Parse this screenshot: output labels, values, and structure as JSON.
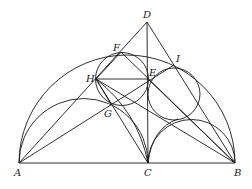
{
  "figure": {
    "type": "geometry-diagram",
    "points": {
      "A": {
        "label": "A",
        "x": 19,
        "y": 163
      },
      "B": {
        "label": "B",
        "x": 235,
        "y": 163
      },
      "C": {
        "label": "C",
        "x": 148,
        "y": 163
      },
      "D": {
        "label": "D",
        "x": 147,
        "y": 22
      },
      "E": {
        "label": "E",
        "x": 148,
        "y": 79
      },
      "F": {
        "label": "F",
        "x": 121,
        "y": 52
      },
      "G": {
        "label": "G",
        "x": 111,
        "y": 104
      },
      "H": {
        "label": "H",
        "x": 96,
        "y": 79
      },
      "I": {
        "label": "I",
        "x": 174,
        "y": 65
      }
    },
    "labels": [
      "A",
      "B",
      "C",
      "D",
      "E",
      "F",
      "G",
      "H",
      "I"
    ],
    "stroke_color": "#1a1a1a",
    "background": "#ffffff"
  }
}
